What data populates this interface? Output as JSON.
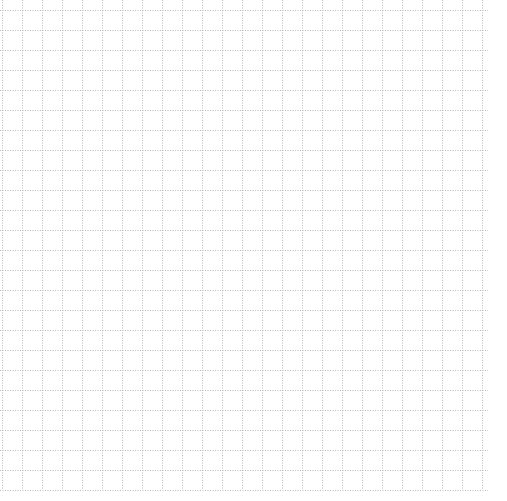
{
  "page": {
    "type": "grid-paper",
    "background": "#ffffff",
    "line_color": "#b8b8b8",
    "line_style": "dotted",
    "cell_size_px": 20,
    "origin_x": 2,
    "origin_y": 0,
    "right_edge_x": 488,
    "bottom_edge_y": 490
  }
}
